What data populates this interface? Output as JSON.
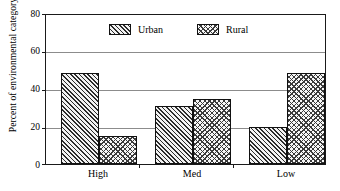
{
  "chart_data": {
    "type": "bar",
    "title": "",
    "subtitle": "",
    "xlabel": "",
    "ylabel": "Percent of environmental category",
    "categories": [
      "High",
      "Med",
      "Low"
    ],
    "series": [
      {
        "name": "Urban",
        "values": [
          49,
          31,
          20
        ],
        "pattern": "diagonal-hatch"
      },
      {
        "name": "Rural",
        "values": [
          15,
          35,
          49
        ],
        "pattern": "crosshatch"
      }
    ],
    "ylim": [
      0,
      80
    ],
    "yticks": [
      0,
      20,
      40,
      60,
      80
    ],
    "ytick_labels": [
      "0",
      "20",
      "40",
      "60",
      "80"
    ],
    "grid": "horizontal",
    "legend_position": "top-inside",
    "frame": true
  },
  "legend": {
    "entries": [
      {
        "label": "Urban",
        "swatch": "diagonal-hatch-swatch"
      },
      {
        "label": "Rural",
        "swatch": "crosshatch-swatch"
      }
    ]
  },
  "colors": {
    "axis": "#1a1a1a",
    "grid": "#8c8c8c",
    "hatch": "#2b2b2b",
    "background": "#ffffff"
  }
}
